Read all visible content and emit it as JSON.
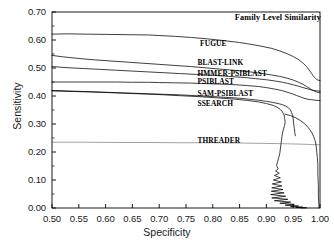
{
  "chart_data": {
    "type": "line",
    "title": "Family Level Similarity",
    "xlabel": "Specificity",
    "ylabel": "Sensitivity",
    "xlim": [
      0.5,
      1.0
    ],
    "ylim": [
      0.0,
      0.7
    ],
    "xticks": [
      "0.50",
      "0.55",
      "0.60",
      "0.65",
      "0.70",
      "0.75",
      "0.80",
      "0.85",
      "0.90",
      "0.95",
      "1.00"
    ],
    "yticks": [
      "0.00",
      "0.10",
      "0.20",
      "0.30",
      "0.40",
      "0.50",
      "0.60",
      "0.70"
    ],
    "xtick_values": [
      0.5,
      0.55,
      0.6,
      0.65,
      0.7,
      0.75,
      0.8,
      0.85,
      0.9,
      0.95,
      1.0
    ],
    "ytick_values": [
      0.0,
      0.1,
      0.2,
      0.3,
      0.4,
      0.5,
      0.6,
      0.7
    ],
    "grid": false,
    "legend": "inline-annotations",
    "series": [
      {
        "name": "FUGUE",
        "label": "FUGUE",
        "color": "#000000",
        "label_x": 0.795,
        "label_y": 0.585,
        "points": [
          [
            0.5,
            0.621
          ],
          [
            0.53,
            0.622
          ],
          [
            0.56,
            0.621
          ],
          [
            0.6,
            0.62
          ],
          [
            0.64,
            0.619
          ],
          [
            0.68,
            0.618
          ],
          [
            0.7,
            0.616
          ],
          [
            0.73,
            0.613
          ],
          [
            0.76,
            0.609
          ],
          [
            0.79,
            0.604
          ],
          [
            0.82,
            0.598
          ],
          [
            0.85,
            0.591
          ],
          [
            0.87,
            0.585
          ],
          [
            0.89,
            0.578
          ],
          [
            0.91,
            0.57
          ],
          [
            0.925,
            0.561
          ],
          [
            0.94,
            0.55
          ],
          [
            0.95,
            0.541
          ],
          [
            0.96,
            0.53
          ],
          [
            0.968,
            0.518
          ],
          [
            0.975,
            0.505
          ],
          [
            0.98,
            0.492
          ],
          [
            0.984,
            0.482
          ],
          [
            0.987,
            0.473
          ],
          [
            0.99,
            0.466
          ],
          [
            0.992,
            0.462
          ],
          [
            0.994,
            0.459
          ],
          [
            0.996,
            0.457
          ],
          [
            0.998,
            0.456
          ],
          [
            1.0,
            0.455
          ]
        ]
      },
      {
        "name": "BLAST-LINK",
        "label": "BLAST-LINK",
        "color": "#000000",
        "label_x": 0.79,
        "label_y": 0.518,
        "points": [
          [
            0.5,
            0.545
          ],
          [
            0.52,
            0.54
          ],
          [
            0.55,
            0.534
          ],
          [
            0.58,
            0.529
          ],
          [
            0.61,
            0.525
          ],
          [
            0.64,
            0.521
          ],
          [
            0.67,
            0.517
          ],
          [
            0.7,
            0.513
          ],
          [
            0.73,
            0.509
          ],
          [
            0.76,
            0.505
          ],
          [
            0.79,
            0.5
          ],
          [
            0.82,
            0.495
          ],
          [
            0.85,
            0.49
          ],
          [
            0.87,
            0.486
          ],
          [
            0.89,
            0.481
          ],
          [
            0.91,
            0.475
          ],
          [
            0.925,
            0.47
          ],
          [
            0.94,
            0.463
          ],
          [
            0.95,
            0.457
          ],
          [
            0.96,
            0.449
          ],
          [
            0.968,
            0.442
          ],
          [
            0.975,
            0.434
          ],
          [
            0.98,
            0.428
          ],
          [
            0.984,
            0.423
          ],
          [
            0.988,
            0.419
          ],
          [
            0.991,
            0.416
          ],
          [
            0.994,
            0.414
          ],
          [
            0.997,
            0.413
          ],
          [
            1.0,
            0.412
          ]
        ]
      },
      {
        "name": "HMMER-PSIBLAST",
        "label": "HMMER-PSIBLAST",
        "color": "#000000",
        "label_x": 0.79,
        "label_y": 0.48,
        "points": [
          [
            0.5,
            0.505
          ],
          [
            0.53,
            0.501
          ],
          [
            0.56,
            0.498
          ],
          [
            0.59,
            0.495
          ],
          [
            0.62,
            0.492
          ],
          [
            0.65,
            0.489
          ],
          [
            0.68,
            0.486
          ],
          [
            0.71,
            0.483
          ],
          [
            0.74,
            0.48
          ],
          [
            0.77,
            0.477
          ],
          [
            0.8,
            0.474
          ],
          [
            0.83,
            0.47
          ],
          [
            0.86,
            0.466
          ],
          [
            0.88,
            0.462
          ],
          [
            0.9,
            0.458
          ],
          [
            0.915,
            0.454
          ],
          [
            0.93,
            0.449
          ],
          [
            0.94,
            0.445
          ],
          [
            0.95,
            0.44
          ],
          [
            0.958,
            0.436
          ],
          [
            0.965,
            0.432
          ],
          [
            0.972,
            0.428
          ],
          [
            0.978,
            0.425
          ],
          [
            0.983,
            0.422
          ],
          [
            0.988,
            0.42
          ],
          [
            0.992,
            0.419
          ],
          [
            0.996,
            0.418
          ],
          [
            1.0,
            0.417
          ]
        ]
      },
      {
        "name": "PSIBLAST",
        "label": "PSIBLAST",
        "color": "#000000",
        "label_x": 0.79,
        "label_y": 0.449,
        "points": [
          [
            0.5,
            0.45
          ],
          [
            0.54,
            0.45
          ],
          [
            0.58,
            0.45
          ],
          [
            0.62,
            0.45
          ],
          [
            0.65,
            0.449
          ],
          [
            0.68,
            0.449
          ],
          [
            0.7,
            0.448
          ],
          [
            0.73,
            0.447
          ],
          [
            0.76,
            0.446
          ],
          [
            0.79,
            0.444
          ],
          [
            0.82,
            0.442
          ],
          [
            0.845,
            0.44
          ],
          [
            0.865,
            0.437
          ],
          [
            0.885,
            0.434
          ],
          [
            0.9,
            0.43
          ],
          [
            0.915,
            0.425
          ],
          [
            0.928,
            0.42
          ],
          [
            0.938,
            0.414
          ],
          [
            0.948,
            0.408
          ],
          [
            0.956,
            0.402
          ],
          [
            0.963,
            0.397
          ],
          [
            0.97,
            0.392
          ],
          [
            0.976,
            0.389
          ],
          [
            0.982,
            0.387
          ],
          [
            0.987,
            0.386
          ],
          [
            0.992,
            0.385
          ],
          [
            0.996,
            0.384
          ],
          [
            1.0,
            0.384
          ]
        ]
      },
      {
        "name": "SAM-PSIBLAST",
        "label": "SAM-PSIBLAST",
        "color": "#000000",
        "label_x": 0.79,
        "label_y": 0.408,
        "points": [
          [
            0.5,
            0.42
          ],
          [
            0.53,
            0.418
          ],
          [
            0.56,
            0.416
          ],
          [
            0.59,
            0.414
          ],
          [
            0.62,
            0.412
          ],
          [
            0.65,
            0.41
          ],
          [
            0.68,
            0.408
          ],
          [
            0.71,
            0.406
          ],
          [
            0.74,
            0.404
          ],
          [
            0.77,
            0.401
          ],
          [
            0.8,
            0.398
          ],
          [
            0.825,
            0.395
          ],
          [
            0.85,
            0.392
          ],
          [
            0.87,
            0.388
          ],
          [
            0.885,
            0.385
          ],
          [
            0.9,
            0.381
          ],
          [
            0.912,
            0.377
          ],
          [
            0.922,
            0.373
          ],
          [
            0.93,
            0.369
          ],
          [
            0.936,
            0.364
          ],
          [
            0.941,
            0.358
          ],
          [
            0.945,
            0.35
          ],
          [
            0.947,
            0.341
          ],
          [
            0.949,
            0.33
          ],
          [
            0.95,
            0.318
          ],
          [
            0.951,
            0.3
          ],
          [
            0.952,
            0.285
          ],
          [
            0.953,
            0.27
          ],
          [
            0.954,
            0.258
          ]
        ]
      },
      {
        "name": "SSEARCH",
        "label": "SSEARCH",
        "color": "#000000",
        "label_x": 0.79,
        "label_y": 0.372,
        "points": [
          [
            0.5,
            0.418
          ],
          [
            0.54,
            0.416
          ],
          [
            0.58,
            0.414
          ],
          [
            0.62,
            0.411
          ],
          [
            0.66,
            0.408
          ],
          [
            0.7,
            0.405
          ],
          [
            0.74,
            0.401
          ],
          [
            0.78,
            0.397
          ],
          [
            0.81,
            0.393
          ],
          [
            0.84,
            0.389
          ],
          [
            0.865,
            0.384
          ],
          [
            0.885,
            0.379
          ],
          [
            0.9,
            0.373
          ],
          [
            0.912,
            0.367
          ],
          [
            0.92,
            0.36
          ],
          [
            0.926,
            0.352
          ],
          [
            0.93,
            0.343
          ],
          [
            0.933,
            0.332
          ],
          [
            0.934,
            0.32
          ],
          [
            0.935,
            0.308
          ],
          [
            0.934,
            0.295
          ],
          [
            0.932,
            0.282
          ],
          [
            0.93,
            0.268
          ],
          [
            0.929,
            0.255
          ],
          [
            0.928,
            0.24
          ],
          [
            0.927,
            0.225
          ],
          [
            0.926,
            0.21
          ],
          [
            0.925,
            0.195
          ],
          [
            0.923,
            0.18
          ],
          [
            0.921,
            0.166
          ],
          [
            0.919,
            0.152
          ],
          [
            0.922,
            0.14
          ],
          [
            0.917,
            0.132
          ],
          [
            0.924,
            0.124
          ],
          [
            0.915,
            0.116
          ],
          [
            0.926,
            0.108
          ],
          [
            0.913,
            0.1
          ],
          [
            0.928,
            0.093
          ],
          [
            0.911,
            0.086
          ],
          [
            0.929,
            0.079
          ],
          [
            0.91,
            0.072
          ],
          [
            0.931,
            0.066
          ],
          [
            0.909,
            0.06
          ],
          [
            0.933,
            0.054
          ],
          [
            0.908,
            0.048
          ],
          [
            0.936,
            0.042
          ],
          [
            0.91,
            0.036
          ],
          [
            0.94,
            0.031
          ],
          [
            0.915,
            0.026
          ],
          [
            0.945,
            0.021
          ],
          [
            0.925,
            0.017
          ],
          [
            0.952,
            0.013
          ],
          [
            0.935,
            0.01
          ],
          [
            0.96,
            0.007
          ],
          [
            0.945,
            0.005
          ],
          [
            0.968,
            0.003
          ],
          [
            0.955,
            0.002
          ],
          [
            0.975,
            0.001
          ],
          [
            0.965,
            0.0
          ]
        ]
      },
      {
        "name": "THREADER",
        "label": "THREADER",
        "color": "#555555",
        "label_x": 0.79,
        "label_y": 0.24,
        "points": [
          [
            0.5,
            0.235
          ],
          [
            0.56,
            0.235
          ],
          [
            0.62,
            0.234
          ],
          [
            0.68,
            0.234
          ],
          [
            0.74,
            0.233
          ],
          [
            0.8,
            0.233
          ],
          [
            0.85,
            0.232
          ],
          [
            0.89,
            0.231
          ],
          [
            0.92,
            0.23
          ],
          [
            0.945,
            0.229
          ],
          [
            0.965,
            0.228
          ],
          [
            0.98,
            0.227
          ],
          [
            0.99,
            0.226
          ],
          [
            1.0,
            0.226
          ]
        ]
      },
      {
        "name": "SSEARCH-upper-branch",
        "label": "",
        "color": "#000000",
        "label_x": null,
        "label_y": null,
        "points": [
          [
            0.935,
            0.335
          ],
          [
            0.945,
            0.33
          ],
          [
            0.955,
            0.322
          ],
          [
            0.963,
            0.313
          ],
          [
            0.97,
            0.303
          ],
          [
            0.976,
            0.292
          ],
          [
            0.981,
            0.28
          ],
          [
            0.985,
            0.268
          ],
          [
            0.988,
            0.256
          ],
          [
            0.99,
            0.245
          ],
          [
            0.992,
            0.232
          ],
          [
            0.993,
            0.218
          ],
          [
            0.994,
            0.2
          ],
          [
            0.995,
            0.18
          ],
          [
            0.996,
            0.155
          ],
          [
            0.996,
            0.12
          ],
          [
            0.997,
            0.08
          ],
          [
            0.997,
            0.04
          ],
          [
            0.998,
            0.01
          ],
          [
            0.998,
            0.0
          ]
        ]
      }
    ]
  }
}
